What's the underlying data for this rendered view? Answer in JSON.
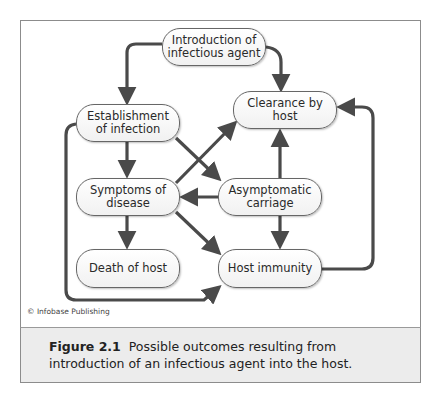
{
  "diagram": {
    "nodes": {
      "introduction": {
        "label": "Introduction of infectious agent",
        "line1": "Introduction of",
        "line2": "infectious agent"
      },
      "establishment": {
        "label": "Establishment of infection",
        "line1": "Establishment",
        "line2": "of infection"
      },
      "clearance": {
        "label": "Clearance by host"
      },
      "symptoms": {
        "label": "Symptoms of disease",
        "line1": "Symptoms of",
        "line2": "disease"
      },
      "asymptomatic": {
        "label": "Asymptomatic carriage",
        "line1": "Asymptomatic",
        "line2": "carriage"
      },
      "death": {
        "label": "Death of host"
      },
      "immunity": {
        "label": "Host immunity"
      }
    },
    "edges": [
      {
        "from": "introduction",
        "to": "establishment"
      },
      {
        "from": "introduction",
        "to": "clearance"
      },
      {
        "from": "establishment",
        "to": "symptoms"
      },
      {
        "from": "establishment",
        "to": "asymptomatic"
      },
      {
        "from": "establishment",
        "to": "immunity"
      },
      {
        "from": "symptoms",
        "to": "clearance"
      },
      {
        "from": "symptoms",
        "to": "death"
      },
      {
        "from": "symptoms",
        "to": "immunity"
      },
      {
        "from": "asymptomatic",
        "to": "symptoms"
      },
      {
        "from": "asymptomatic",
        "to": "clearance"
      },
      {
        "from": "asymptomatic",
        "to": "immunity"
      },
      {
        "from": "immunity",
        "to": "clearance"
      }
    ],
    "arrow_color": "#4a4a4a"
  },
  "credit": "© Infobase Publishing",
  "caption": {
    "figure_label": "Figure 2.1",
    "text": "Possible outcomes resulting from introduction of an infectious agent into the host."
  }
}
